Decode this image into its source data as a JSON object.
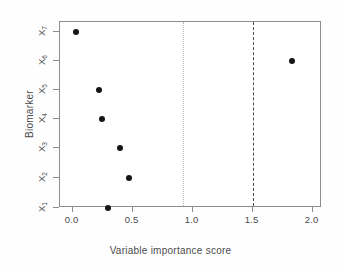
{
  "chart_data": {
    "type": "scatter",
    "title": "",
    "xlabel": "Variable importance score",
    "ylabel": "Biomarker",
    "categories": [
      "X1",
      "X2",
      "X3",
      "X4",
      "X5",
      "X6",
      "X7"
    ],
    "category_labels": [
      {
        "base": "X",
        "sub": "1"
      },
      {
        "base": "X",
        "sub": "2"
      },
      {
        "base": "X",
        "sub": "3"
      },
      {
        "base": "X",
        "sub": "4"
      },
      {
        "base": "X",
        "sub": "5"
      },
      {
        "base": "X",
        "sub": "6"
      },
      {
        "base": "X",
        "sub": "7"
      }
    ],
    "values": [
      0.29,
      0.47,
      0.39,
      0.24,
      0.22,
      1.83,
      0.03
    ],
    "points": [
      {
        "category": "X1",
        "value": 0.29
      },
      {
        "category": "X2",
        "value": 0.47
      },
      {
        "category": "X3",
        "value": 0.39
      },
      {
        "category": "X4",
        "value": 0.24
      },
      {
        "category": "X5",
        "value": 0.22
      },
      {
        "category": "X6",
        "value": 1.83
      },
      {
        "category": "X7",
        "value": 0.03
      }
    ],
    "xlim": [
      -0.1,
      2.08
    ],
    "ylim_categories_order_bottom_to_top": [
      "X1",
      "X2",
      "X3",
      "X4",
      "X5",
      "X6",
      "X7"
    ],
    "xticks": [
      0.0,
      0.5,
      1.0,
      1.5,
      2.0
    ],
    "xtick_labels": [
      "0.0",
      "0.5",
      "1.0",
      "1.5",
      "2.0"
    ],
    "grid": false,
    "legend": null,
    "annotations": [
      {
        "name": "threshold-dotted",
        "type": "vline",
        "value": 0.92,
        "style": "dotted",
        "color": "#b9b9b9"
      },
      {
        "name": "threshold-dashed",
        "type": "vline",
        "value": 1.5,
        "style": "dashed",
        "color": "#4a4a4a"
      }
    ],
    "marker": {
      "shape": "circle",
      "filled": true,
      "color": "#151515",
      "size_px": 6
    },
    "colors": {
      "background": "#ffffff",
      "axis": "#8d8d8d",
      "text": "#4b4b4b",
      "point": "#151515",
      "dotted_line": "#b9b9b9",
      "dashed_line": "#4a4a4a"
    }
  }
}
